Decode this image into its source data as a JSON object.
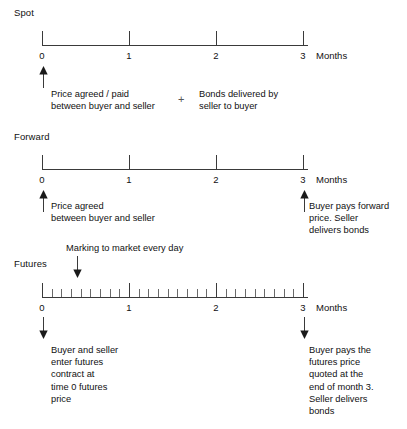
{
  "figure": {
    "axis_unit_label": "Months",
    "tick_labels": [
      "0",
      "1",
      "2",
      "3"
    ],
    "minor_ticks_per_month": 8
  },
  "sections": {
    "spot": {
      "label": "Spot",
      "notes": {
        "agreed": "Price agreed / paid\nbetween buyer and seller",
        "plus": "+",
        "delivered": "Bonds delivered by\nseller to buyer"
      }
    },
    "forward": {
      "label": "Forward",
      "notes": {
        "agreed": "Price agreed\nbetween buyer and seller",
        "settle": "Buyer pays forward\nprice. Seller\ndelivers bonds"
      }
    },
    "futures": {
      "label": "Futures",
      "notes": {
        "marking": "Marking to market every day",
        "enter": "Buyer and seller\nenter futures\ncontract at\ntime 0 futures\nprice",
        "settle": "Buyer pays the\nfutures price\nquoted at the\nend of month 3.\nSeller delivers\nbonds"
      }
    }
  },
  "colors": {
    "ink": "#111111",
    "line": "#3a3a3a",
    "minor_tick": "#6a6a6a",
    "background": "#ffffff"
  }
}
